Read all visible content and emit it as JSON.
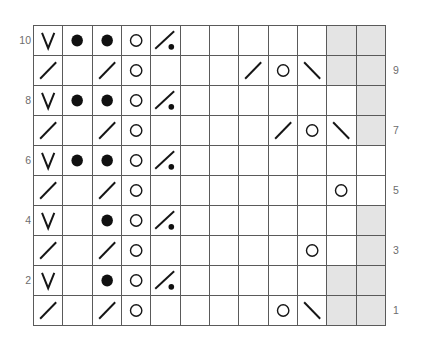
{
  "chart_data": {
    "type": "table",
    "title": "",
    "xlabel": "",
    "ylabel": "",
    "grid": {
      "columns": 12,
      "rows": 10
    },
    "legend": {
      "v": "slip-stitch (V)",
      "dot": "purl / filled dot",
      "circle": "yarn over (open circle)",
      "slash": "right-leaning decrease (/)",
      "backslash": "left-leaning decrease (\\)",
      "slash_dot": "decrease with purl dot (/.)",
      "empty": "knit (blank square)",
      "shaded": "no stitch (grey square)"
    },
    "row_labels_left": [
      "10",
      "",
      "8",
      "",
      "6",
      "",
      "4",
      "",
      "2",
      ""
    ],
    "row_labels_right": [
      "",
      "9",
      "",
      "7",
      "",
      "5",
      "",
      "3",
      "",
      "1"
    ],
    "rows": [
      {
        "number": "10",
        "side": "left",
        "cells": [
          "v",
          "dot",
          "dot",
          "circle",
          "slash_dot",
          "empty",
          "empty",
          "empty",
          "empty",
          "empty",
          "shaded",
          "shaded"
        ]
      },
      {
        "number": "9",
        "side": "right",
        "cells": [
          "slash",
          "empty",
          "slash",
          "circle",
          "empty",
          "empty",
          "empty",
          "slash",
          "circle",
          "backslash",
          "shaded",
          "shaded"
        ]
      },
      {
        "number": "8",
        "side": "left",
        "cells": [
          "v",
          "dot",
          "dot",
          "circle",
          "slash_dot",
          "empty",
          "empty",
          "empty",
          "empty",
          "empty",
          "empty",
          "shaded"
        ]
      },
      {
        "number": "7",
        "side": "right",
        "cells": [
          "slash",
          "empty",
          "slash",
          "circle",
          "empty",
          "empty",
          "empty",
          "empty",
          "slash",
          "circle",
          "backslash",
          "shaded"
        ]
      },
      {
        "number": "6",
        "side": "left",
        "cells": [
          "v",
          "dot",
          "dot",
          "circle",
          "slash_dot",
          "empty",
          "empty",
          "empty",
          "empty",
          "empty",
          "empty",
          "empty"
        ]
      },
      {
        "number": "5",
        "side": "right",
        "cells": [
          "slash",
          "empty",
          "slash",
          "circle",
          "empty",
          "empty",
          "empty",
          "empty",
          "empty",
          "empty",
          "circle",
          "empty"
        ]
      },
      {
        "number": "4",
        "side": "left",
        "cells": [
          "v",
          "empty",
          "dot",
          "circle",
          "slash_dot",
          "empty",
          "empty",
          "empty",
          "empty",
          "empty",
          "empty",
          "shaded"
        ]
      },
      {
        "number": "3",
        "side": "right",
        "cells": [
          "slash",
          "empty",
          "slash",
          "circle",
          "empty",
          "empty",
          "empty",
          "empty",
          "empty",
          "circle",
          "empty",
          "shaded"
        ]
      },
      {
        "number": "2",
        "side": "left",
        "cells": [
          "v",
          "empty",
          "dot",
          "circle",
          "slash_dot",
          "empty",
          "empty",
          "empty",
          "empty",
          "empty",
          "shaded",
          "shaded"
        ]
      },
      {
        "number": "1",
        "side": "right",
        "cells": [
          "slash",
          "empty",
          "slash",
          "circle",
          "empty",
          "empty",
          "empty",
          "empty",
          "circle",
          "backslash",
          "shaded",
          "shaded"
        ]
      }
    ]
  },
  "colors": {
    "grid_line": "#5a5a5a",
    "symbol": "#161616",
    "shaded_cell": "#e4e4e4",
    "label_text": "#6d6d6d",
    "background": "#ffffff"
  }
}
